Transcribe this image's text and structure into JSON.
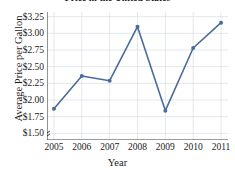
{
  "chart_data": {
    "type": "line",
    "title": "Price in the United States",
    "xlabel": "Year",
    "ylabel": "Average Price per Gallon",
    "categories": [
      2005,
      2006,
      2007,
      2008,
      2009,
      2010,
      2011
    ],
    "x_tick_labels": [
      "2005",
      "2006",
      "2007",
      "2008",
      "2009",
      "2010",
      "2011"
    ],
    "values": [
      1.87,
      2.36,
      2.29,
      3.1,
      1.84,
      2.78,
      3.16
    ],
    "y_ticks": [
      1.5,
      1.75,
      2.0,
      2.25,
      2.5,
      2.75,
      3.0,
      3.25
    ],
    "y_tick_labels": [
      "$1.50",
      "$1.75",
      "$2.00",
      "$2.25",
      "$2.50",
      "$2.75",
      "$3.00",
      "$3.25"
    ],
    "ylim": [
      1.4,
      3.32
    ],
    "xlim": [
      2004.75,
      2011.25
    ],
    "grid": true,
    "legend": "none",
    "axis_break": true,
    "series_color": "#4a6c9b",
    "marker": "circle",
    "grid_color": "#d8dde4",
    "axis_color": "#3a3a3a"
  }
}
